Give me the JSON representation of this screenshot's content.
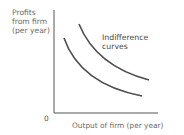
{
  "diagram": {
    "y_axis_label_lines": [
      "Profits",
      "from firm",
      "(per year)"
    ],
    "x_axis_label": "Output of firm (per year)",
    "origin_label": "0",
    "curve_label_lines": [
      "Indifference",
      "curves"
    ],
    "colors": {
      "axis": "#555555",
      "curve": "#4d4d4d",
      "text": "#6a6a6a"
    }
  }
}
